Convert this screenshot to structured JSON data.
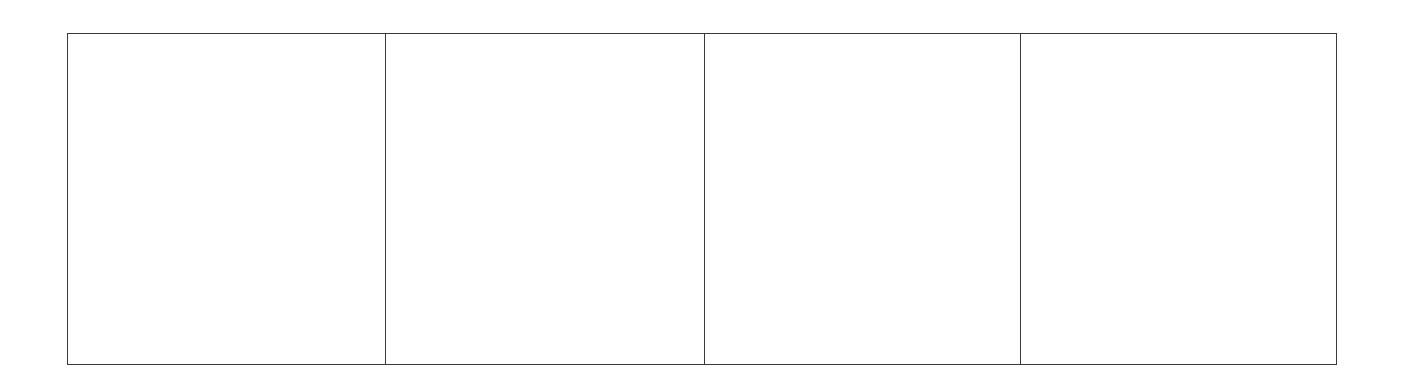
{
  "layout": {
    "type": "panel-grid",
    "rows": 1,
    "columns": 4,
    "border_color": "#3a3a3a",
    "background_color": "#ffffff"
  },
  "panels": [
    {
      "index": 1,
      "content": ""
    },
    {
      "index": 2,
      "content": ""
    },
    {
      "index": 3,
      "content": ""
    },
    {
      "index": 4,
      "content": ""
    }
  ]
}
